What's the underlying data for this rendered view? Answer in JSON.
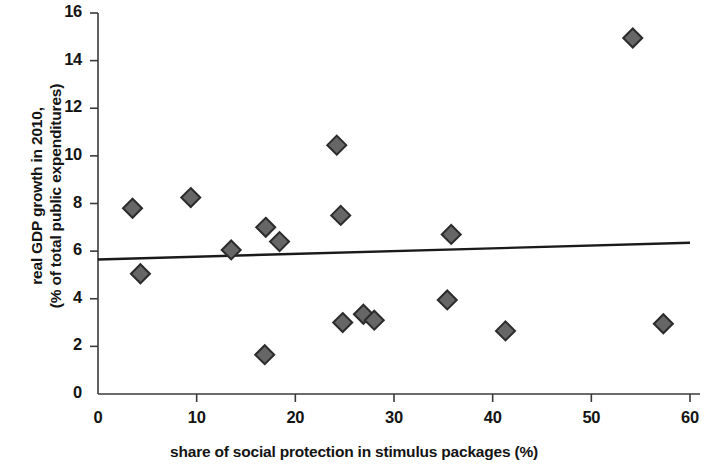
{
  "chart_data": {
    "type": "scatter",
    "title": "",
    "xlabel": "share of social protection in stimulus packages (%)",
    "ylabel_line1": "real GDP growth in 2010,",
    "ylabel_line2": "(% of total public expenditures)",
    "xlim": [
      0,
      60
    ],
    "ylim": [
      0,
      16
    ],
    "xticks": [
      "0",
      "10",
      "20",
      "30",
      "40",
      "50",
      "60"
    ],
    "xtick_values": [
      0,
      10,
      20,
      30,
      40,
      50,
      60
    ],
    "yticks": [
      "0",
      "2",
      "4",
      "6",
      "8",
      "10",
      "12",
      "14",
      "16"
    ],
    "ytick_values": [
      0,
      2,
      4,
      6,
      8,
      10,
      12,
      14,
      16
    ],
    "grid": false,
    "legend": "none",
    "marker": "diamond",
    "marker_color": "#666666",
    "marker_edge_color": "#2b2b2b",
    "trendline_color": "#1a1a1a",
    "points": [
      {
        "x": 3.5,
        "y": 7.8
      },
      {
        "x": 4.3,
        "y": 5.05
      },
      {
        "x": 9.4,
        "y": 8.25
      },
      {
        "x": 13.5,
        "y": 6.05
      },
      {
        "x": 16.9,
        "y": 1.65
      },
      {
        "x": 17.0,
        "y": 7.0
      },
      {
        "x": 18.4,
        "y": 6.4
      },
      {
        "x": 24.2,
        "y": 10.45
      },
      {
        "x": 24.6,
        "y": 7.5
      },
      {
        "x": 24.8,
        "y": 3.0
      },
      {
        "x": 26.9,
        "y": 3.35
      },
      {
        "x": 28.0,
        "y": 3.1
      },
      {
        "x": 35.4,
        "y": 3.95
      },
      {
        "x": 35.8,
        "y": 6.7
      },
      {
        "x": 41.3,
        "y": 2.65
      },
      {
        "x": 54.2,
        "y": 14.95
      },
      {
        "x": 57.3,
        "y": 2.95
      }
    ],
    "trendline": {
      "x_start": 0,
      "y_start": 5.65,
      "x_end": 60,
      "y_end": 6.35
    }
  }
}
